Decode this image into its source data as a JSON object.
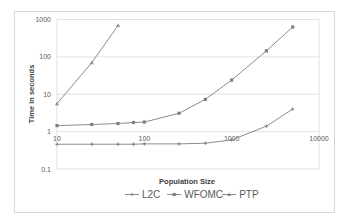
{
  "chart_data": {
    "type": "line",
    "title": "",
    "xlabel": "Population Size",
    "ylabel": "Time in seconds",
    "xscale": "log",
    "yscale": "log",
    "xlim": [
      10,
      10000
    ],
    "ylim": [
      0.1,
      1000
    ],
    "x_ticks": [
      "10",
      "100",
      "1000",
      "10000"
    ],
    "y_ticks": [
      "0.1",
      "1",
      "10",
      "100",
      "1000"
    ],
    "grid": {
      "horizontal": true,
      "vertical": false
    },
    "legend_position": "bottom",
    "series": [
      {
        "name": "L2C",
        "marker": "plus",
        "x": [
          10,
          25,
          50,
          75,
          100,
          250,
          500,
          1000,
          2500,
          5000
        ],
        "values": [
          0.46,
          0.46,
          0.46,
          0.46,
          0.47,
          0.47,
          0.49,
          0.6,
          1.4,
          4
        ]
      },
      {
        "name": "WFOMC",
        "marker": "square",
        "x": [
          10,
          25,
          50,
          75,
          100,
          250,
          500,
          1000,
          2500,
          5000
        ],
        "values": [
          1.45,
          1.55,
          1.65,
          1.75,
          1.8,
          3.1,
          7.3,
          24,
          145,
          630
        ]
      },
      {
        "name": "PTP",
        "marker": "triangle",
        "x": [
          10,
          25,
          50
        ],
        "values": [
          5.6,
          70,
          690
        ]
      }
    ]
  },
  "colors": {
    "series_line": "#8c8c8c",
    "gridline": "#d9d9d9",
    "text": "#595959",
    "frame": "#d9d9d9"
  }
}
